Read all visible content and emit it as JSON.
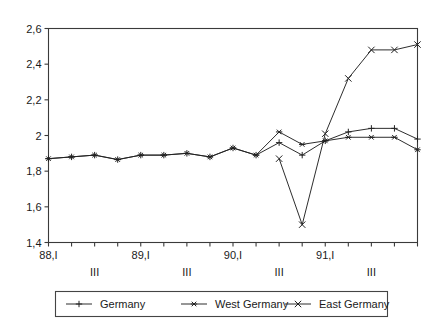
{
  "chart_data": {
    "type": "line",
    "title": "",
    "subtitle": "",
    "xlabel": "",
    "ylabel": "",
    "ylim": [
      1.4,
      2.6
    ],
    "ytick_labels": [
      "2,6",
      "2,4",
      "2,2",
      "2",
      "1,8",
      "1,6",
      "1,4"
    ],
    "ytick_values": [
      2.6,
      2.4,
      2.2,
      2.0,
      1.8,
      1.6,
      1.4
    ],
    "grid": false,
    "legend_position": "bottom",
    "x": [
      "88,I",
      "88,II",
      "88,III",
      "88,IV",
      "89,I",
      "89,II",
      "89,III",
      "89,IV",
      "90,I",
      "90,II",
      "90,III",
      "90,IV",
      "91,I",
      "91,II",
      "91,III",
      "91,IV",
      "92,I"
    ],
    "xtick_labels": [
      "88,I",
      "",
      "III",
      "",
      "89,I",
      "",
      "III",
      "",
      "90,I",
      "",
      "III",
      "",
      "91,I",
      "",
      "III",
      "",
      ""
    ],
    "series": [
      {
        "name": "Germany",
        "marker": "plus",
        "color": "#222222",
        "values": [
          1.87,
          1.88,
          1.89,
          1.865,
          1.89,
          1.89,
          1.9,
          1.88,
          1.93,
          1.89,
          1.96,
          1.89,
          1.97,
          2.02,
          2.04,
          2.04,
          1.98
        ]
      },
      {
        "name": "West Germany",
        "marker": "asterisk",
        "color": "#222222",
        "values": [
          1.87,
          1.88,
          1.89,
          1.865,
          1.89,
          1.89,
          1.9,
          1.88,
          1.93,
          1.89,
          2.02,
          1.95,
          1.97,
          1.99,
          1.99,
          1.99,
          1.92
        ]
      },
      {
        "name": "East Germany",
        "marker": "cross",
        "color": "#222222",
        "values": [
          null,
          null,
          null,
          null,
          null,
          null,
          null,
          null,
          null,
          null,
          1.87,
          1.5,
          2.01,
          2.32,
          2.48,
          2.48,
          2.51
        ]
      }
    ]
  },
  "legend": {
    "entries": [
      {
        "label": "Germany",
        "marker": "plus"
      },
      {
        "label": "West Germany",
        "marker": "asterisk"
      },
      {
        "label": "East Germany",
        "marker": "cross"
      }
    ]
  },
  "colors": {
    "axis": "#3a3a3a",
    "line": "#222222",
    "legend_border": "#444444",
    "background": "#ffffff"
  }
}
